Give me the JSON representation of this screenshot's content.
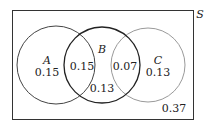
{
  "diagram": {
    "type": "venn",
    "universe_label": "S",
    "sets": [
      {
        "name": "A",
        "only_value": "0.15",
        "color": "#444444"
      },
      {
        "name": "B",
        "color": "#222222"
      },
      {
        "name": "C",
        "only_value": "0.13",
        "color": "#999999"
      }
    ],
    "regions": {
      "A_and_B": "0.15",
      "B_only": "0.13",
      "B_and_C": "0.07",
      "outside": "0.37"
    }
  }
}
